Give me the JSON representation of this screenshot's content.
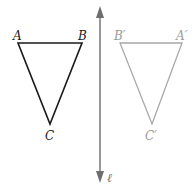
{
  "diagram": {
    "original": {
      "labels": {
        "A": "A",
        "B": "B",
        "C": "C"
      },
      "color": "#1a1a1a"
    },
    "image": {
      "labels": {
        "A": "A′",
        "B": "B′",
        "C": "C′"
      },
      "color": "#9a9a9a"
    },
    "line": {
      "label": "ℓ",
      "color": "#6e6e6e"
    }
  }
}
